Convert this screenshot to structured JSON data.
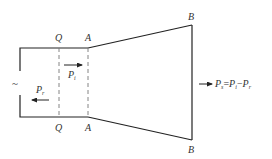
{
  "diagram": {
    "type": "waveguide-horn-power-flow",
    "colors": {
      "stroke": "#222222",
      "dashed": "#777777",
      "text": "#333333",
      "background": "#ffffff"
    },
    "labels": {
      "q_top": "Q",
      "a_top": "A",
      "b_top": "B",
      "q_bottom": "Q",
      "a_bottom": "A",
      "b_bottom": "B",
      "source_symbol": "~"
    },
    "incident_power": {
      "symbol": "P",
      "subscript": "i",
      "direction": "right"
    },
    "reflected_power": {
      "symbol": "P",
      "subscript": "r",
      "direction": "left"
    },
    "transmitted_power": {
      "symbol": "P",
      "subscript": "s",
      "equals": "=",
      "term1_symbol": "P",
      "term1_subscript": "i",
      "minus": "−",
      "term2_symbol": "P",
      "term2_subscript": "r",
      "direction": "right"
    }
  }
}
